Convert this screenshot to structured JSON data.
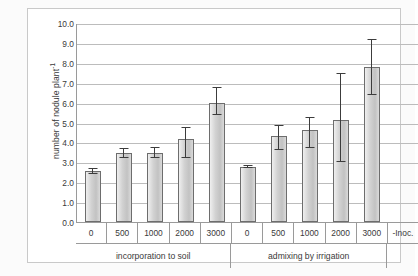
{
  "chart_data": {
    "type": "bar",
    "title": "",
    "xlabel": "",
    "ylabel": "number of nodule plant-1",
    "ylabel_base": "number of nodule plant",
    "ylabel_exponent": "-1",
    "ylim": [
      0.0,
      10.0
    ],
    "ytick_labels": [
      "10.0",
      "9.0",
      "8.0",
      "7.0",
      "6.0",
      "5.0",
      "4.0",
      "3.0",
      "2.0",
      "1.0",
      "0.0"
    ],
    "ytick_values": [
      10.0,
      9.0,
      8.0,
      7.0,
      6.0,
      5.0,
      4.0,
      3.0,
      2.0,
      1.0,
      0.0
    ],
    "grid": true,
    "legend": "none",
    "categories": [
      "0",
      "500",
      "1000",
      "2000",
      "3000",
      "0",
      "500",
      "1000",
      "2000",
      "3000",
      "-Inoc."
    ],
    "groups": [
      {
        "label": "incorporation to soil",
        "span": 5
      },
      {
        "label": "admixing by irrigation",
        "span": 5
      },
      {
        "label": "",
        "span": 1
      }
    ],
    "values": [
      2.55,
      3.45,
      3.45,
      4.15,
      6.0,
      2.75,
      4.3,
      4.6,
      5.15,
      7.8,
      null
    ],
    "error_low": [
      2.4,
      3.2,
      3.2,
      3.2,
      5.4,
      2.7,
      3.6,
      3.7,
      3.0,
      6.4,
      null
    ],
    "error_high": [
      2.7,
      3.7,
      3.75,
      4.8,
      6.8,
      2.85,
      4.9,
      5.3,
      7.5,
      9.2,
      null
    ],
    "bar_fill": "#d2d2d2",
    "bar_edge": "#6d6d6d",
    "grid_color": "#bcbcbc",
    "axis_color": "#9a9a9a",
    "text_color": "#3a3a3a"
  }
}
